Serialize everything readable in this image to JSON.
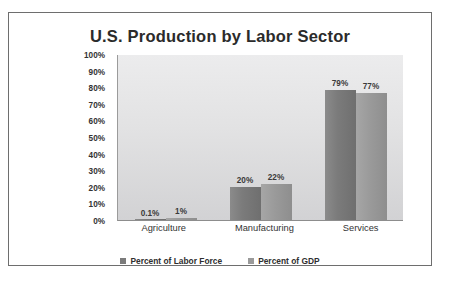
{
  "chart_data": {
    "type": "bar",
    "title": "U.S. Production by Labor Sector",
    "xlabel": "",
    "ylabel": "",
    "ylim": [
      0,
      100
    ],
    "yticks": [
      "100%",
      "90%",
      "80%",
      "70%",
      "60%",
      "50%",
      "40%",
      "30%",
      "20%",
      "10%",
      "0%"
    ],
    "grid": false,
    "legend_position": "bottom-center",
    "categories": [
      "Agriculture",
      "Manufacturing",
      "Services"
    ],
    "series": [
      {
        "name": "Percent of Labor Force",
        "color": "#7b7b7b",
        "values": [
          0.1,
          20,
          79
        ],
        "labels": [
          "0.1%",
          "20%",
          "79%"
        ]
      },
      {
        "name": "Percent of GDP",
        "color": "#9a9a9a",
        "values": [
          1,
          22,
          77
        ],
        "labels": [
          "1%",
          "22%",
          "77%"
        ]
      }
    ]
  },
  "colors": {
    "frame_border": "#6e6e6e",
    "plot_background": "#e4e4e5",
    "title_text": "#2b2b2b",
    "axis_text": "#333333"
  }
}
